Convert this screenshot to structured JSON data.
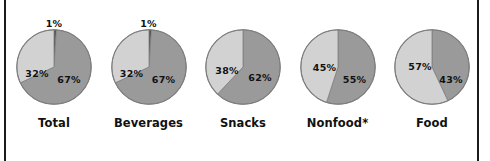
{
  "figure": {
    "background_color": "#ffffff",
    "rule_color": "#1b1b1b",
    "outline_color": "#7d7d7d"
  },
  "chart_data": {
    "type": "pie",
    "title": "",
    "subtitle": "",
    "xlabel": "",
    "ylabel": "",
    "legend_position": "none",
    "grid": false,
    "units": "percent",
    "series_colors": {
      "dark_gray": "#9a9a9a",
      "light_gray": "#d2d2d2",
      "near_black": "#3a3a3a"
    },
    "charts": [
      {
        "name": "Total",
        "label": "Total",
        "note": "1%",
        "note_visible": true,
        "slices": [
          {
            "label": "1%",
            "value": 1,
            "color": "#3a3a3a",
            "show_inline_label": false,
            "label_x": 50,
            "label_y": 10
          },
          {
            "label": "67%",
            "value": 67,
            "color": "#9a9a9a",
            "show_inline_label": true,
            "label_x": 53,
            "label_y": 50
          },
          {
            "label": "32%",
            "value": 32,
            "color": "#d2d2d2",
            "show_inline_label": true,
            "label_x": 21,
            "label_y": 44
          }
        ]
      },
      {
        "name": "Beverages",
        "label": "Beverages",
        "note": "1%",
        "note_visible": true,
        "slices": [
          {
            "label": "1%",
            "value": 1,
            "color": "#3a3a3a",
            "show_inline_label": false,
            "label_x": 50,
            "label_y": 10
          },
          {
            "label": "67%",
            "value": 67,
            "color": "#9a9a9a",
            "show_inline_label": true,
            "label_x": 53,
            "label_y": 50
          },
          {
            "label": "32%",
            "value": 32,
            "color": "#d2d2d2",
            "show_inline_label": true,
            "label_x": 21,
            "label_y": 44
          }
        ]
      },
      {
        "name": "Snacks",
        "label": "Snacks",
        "note": "",
        "note_visible": false,
        "slices": [
          {
            "label": "62%",
            "value": 62,
            "color": "#9a9a9a",
            "show_inline_label": true,
            "label_x": 55,
            "label_y": 48
          },
          {
            "label": "38%",
            "value": 38,
            "color": "#d2d2d2",
            "show_inline_label": true,
            "label_x": 22,
            "label_y": 41
          }
        ]
      },
      {
        "name": "Nonfood",
        "label": "Nonfood*",
        "note": "",
        "note_visible": false,
        "slices": [
          {
            "label": "55%",
            "value": 55,
            "color": "#9a9a9a",
            "show_inline_label": true,
            "label_x": 55,
            "label_y": 50
          },
          {
            "label": "45%",
            "value": 45,
            "color": "#d2d2d2",
            "show_inline_label": true,
            "label_x": 25,
            "label_y": 38
          }
        ]
      },
      {
        "name": "Food",
        "label": "Food",
        "note": "",
        "note_visible": false,
        "slices": [
          {
            "label": "43%",
            "value": 43,
            "color": "#9a9a9a",
            "show_inline_label": true,
            "label_x": 57,
            "label_y": 50
          },
          {
            "label": "57%",
            "value": 57,
            "color": "#d2d2d2",
            "show_inline_label": true,
            "label_x": 26,
            "label_y": 37
          }
        ]
      }
    ]
  }
}
